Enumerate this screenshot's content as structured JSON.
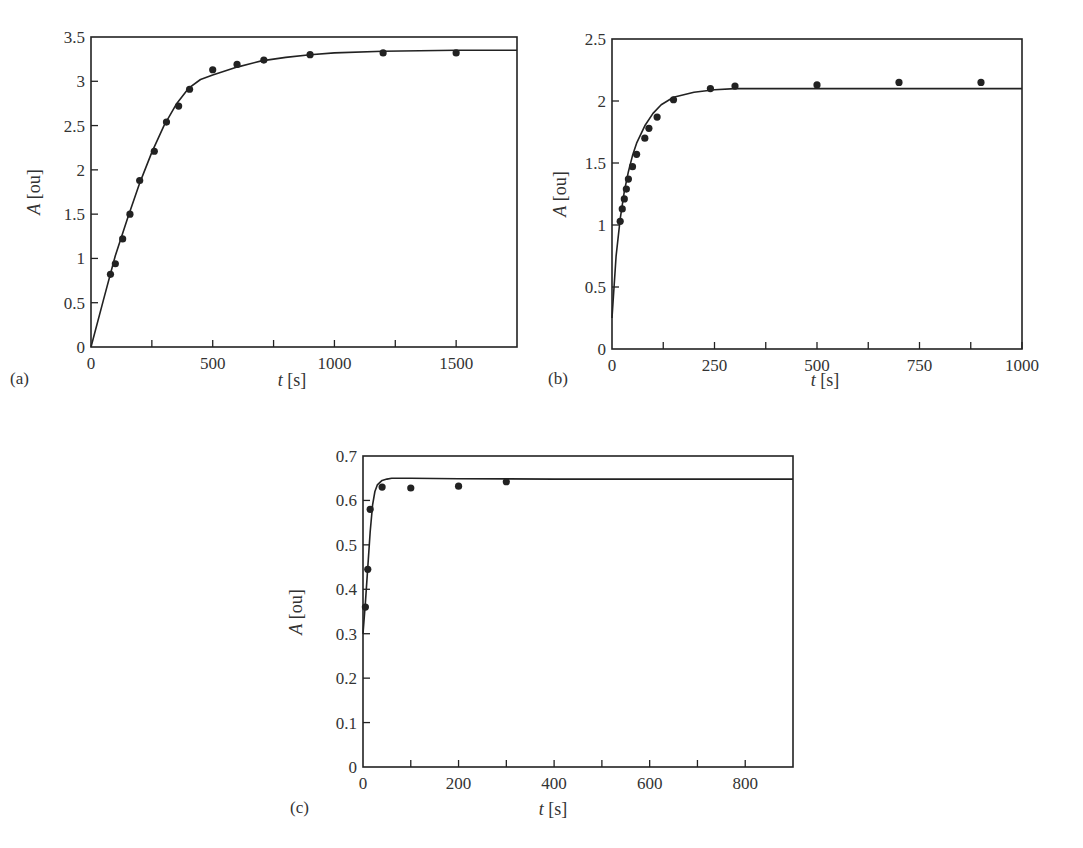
{
  "chart_data": [
    {
      "panel": "(a)",
      "type": "scatter",
      "title": "",
      "xlabel": "t [s]",
      "ylabel": "A [ou]",
      "xlim": [
        0,
        1750
      ],
      "ylim": [
        0,
        3.5
      ],
      "xticks": [
        0,
        500,
        1000,
        1500
      ],
      "xticks_minor": [
        250,
        750,
        1250
      ],
      "yticks": [
        0,
        0.5,
        1,
        1.5,
        2,
        2.5,
        3,
        3.5
      ],
      "ytick_labels": [
        "0",
        "0.5",
        "1",
        "1.5",
        "2",
        "2.5",
        "3",
        "3.5"
      ],
      "xtick_labels": [
        "0",
        "500",
        "1000",
        "1500"
      ],
      "grid": false,
      "series": [
        {
          "name": "measured",
          "style": "markers",
          "x": [
            80,
            100,
            130,
            160,
            200,
            260,
            310,
            360,
            405,
            500,
            600,
            710,
            900,
            1200,
            1500
          ],
          "y": [
            0.82,
            0.94,
            1.22,
            1.5,
            1.88,
            2.21,
            2.54,
            2.72,
            2.91,
            3.13,
            3.19,
            3.24,
            3.3,
            3.32,
            3.32
          ]
        },
        {
          "name": "fit",
          "style": "line",
          "model": "A = Amax*(1-exp(-t/tau)) with onset curvature",
          "x": [
            0,
            50,
            100,
            150,
            200,
            250,
            300,
            350,
            400,
            450,
            500,
            600,
            700,
            800,
            900,
            1000,
            1200,
            1500,
            1750
          ],
          "y": [
            0,
            0.52,
            1.03,
            1.45,
            1.85,
            2.2,
            2.5,
            2.74,
            2.92,
            3.02,
            3.07,
            3.16,
            3.23,
            3.27,
            3.3,
            3.32,
            3.34,
            3.35,
            3.35
          ]
        }
      ]
    },
    {
      "panel": "(b)",
      "type": "scatter",
      "title": "",
      "xlabel": "t [s]",
      "ylabel": "A [ou]",
      "xlim": [
        0,
        1000
      ],
      "ylim": [
        0,
        2.5
      ],
      "xticks": [
        0,
        250,
        500,
        750,
        1000
      ],
      "xticks_minor": [
        125,
        375,
        625,
        875
      ],
      "xtick_labels": [
        "0",
        "250",
        "500",
        "750",
        "1000"
      ],
      "yticks": [
        0,
        0.5,
        1,
        1.5,
        2,
        2.5
      ],
      "ytick_labels": [
        "0",
        "0.5",
        "1",
        "1.5",
        "2",
        "2.5"
      ],
      "grid": false,
      "series": [
        {
          "name": "measured",
          "style": "markers",
          "x": [
            20,
            25,
            30,
            35,
            40,
            50,
            60,
            80,
            90,
            110,
            150,
            240,
            300,
            500,
            700,
            900
          ],
          "y": [
            1.03,
            1.13,
            1.21,
            1.29,
            1.37,
            1.47,
            1.57,
            1.7,
            1.78,
            1.87,
            2.01,
            2.1,
            2.12,
            2.13,
            2.15,
            2.15
          ]
        },
        {
          "name": "fit",
          "style": "line",
          "x": [
            0,
            10,
            20,
            30,
            40,
            50,
            60,
            80,
            100,
            120,
            150,
            200,
            250,
            300,
            400,
            600,
            800,
            1000
          ],
          "y": [
            0.25,
            0.75,
            1.05,
            1.27,
            1.43,
            1.56,
            1.66,
            1.8,
            1.9,
            1.97,
            2.03,
            2.07,
            2.09,
            2.1,
            2.1,
            2.1,
            2.1,
            2.1
          ]
        }
      ]
    },
    {
      "panel": "(c)",
      "type": "scatter",
      "title": "",
      "xlabel": "t [s]",
      "ylabel": "A [ou]",
      "xlim": [
        0,
        900
      ],
      "ylim": [
        0,
        0.7
      ],
      "xticks": [
        0,
        200,
        400,
        600,
        800
      ],
      "xticks_minor": [
        100,
        300,
        500,
        700
      ],
      "xtick_labels": [
        "0",
        "200",
        "400",
        "600",
        "800"
      ],
      "yticks": [
        0,
        0.1,
        0.2,
        0.3,
        0.4,
        0.5,
        0.6,
        0.7
      ],
      "ytick_labels": [
        "0",
        "0.1",
        "0.2",
        "0.3",
        "0.4",
        "0.5",
        "0.6",
        "0.7"
      ],
      "grid": false,
      "series": [
        {
          "name": "measured",
          "style": "markers",
          "x": [
            5,
            10,
            15,
            40,
            100,
            200,
            300
          ],
          "y": [
            0.36,
            0.445,
            0.58,
            0.63,
            0.628,
            0.632,
            0.642
          ]
        },
        {
          "name": "fit",
          "style": "line",
          "x": [
            0,
            5,
            10,
            15,
            20,
            25,
            30,
            40,
            50,
            60,
            80,
            100,
            200,
            400,
            900
          ],
          "y": [
            0.3,
            0.37,
            0.45,
            0.53,
            0.59,
            0.62,
            0.635,
            0.645,
            0.648,
            0.65,
            0.65,
            0.65,
            0.649,
            0.648,
            0.648
          ]
        }
      ]
    }
  ],
  "panels": {
    "a": {
      "label": "(a)",
      "xlabel_italic": "t",
      "xlabel_unit": "[s]",
      "ylabel_italic": "A",
      "ylabel_unit": "[ou]"
    },
    "b": {
      "label": "(b)",
      "xlabel_italic": "t",
      "xlabel_unit": "[s]",
      "ylabel_italic": "A",
      "ylabel_unit": "[ou]"
    },
    "c": {
      "label": "(c)",
      "xlabel_italic": "t",
      "xlabel_unit": "[s]",
      "ylabel_italic": "A",
      "ylabel_unit": "[ou]"
    }
  },
  "colors": {
    "ink": "#222222",
    "background": "#ffffff"
  }
}
